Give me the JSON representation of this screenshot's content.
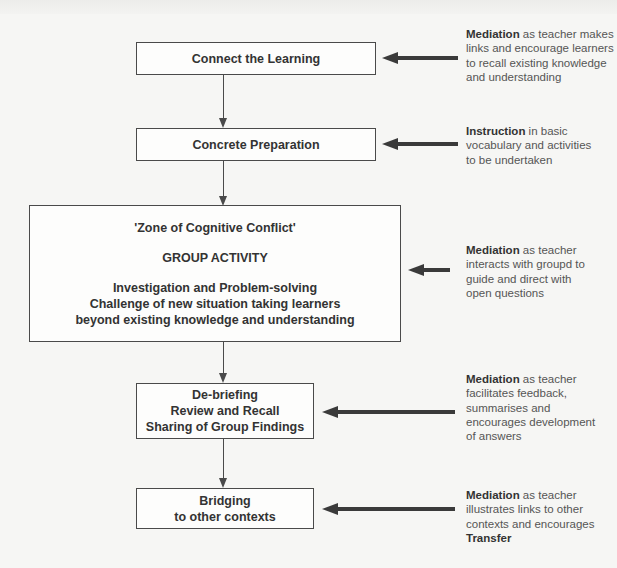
{
  "diagram": {
    "title": "",
    "steps": [
      {
        "id": "connect",
        "lines": [
          "Connect the Learning"
        ]
      },
      {
        "id": "concrete",
        "lines": [
          "Concrete Preparation"
        ]
      },
      {
        "id": "zone",
        "heading": "'Zone of Cognitive Conflict'",
        "subheading": "GROUP ACTIVITY",
        "lines": [
          "Investigation and Problem-solving",
          "Challenge of new situation taking learners",
          "beyond existing knowledge and understanding"
        ]
      },
      {
        "id": "debrief",
        "lines": [
          "De-briefing",
          "Review and Recall",
          "Sharing of Group Findings"
        ]
      },
      {
        "id": "bridging",
        "lines": [
          "Bridging",
          "to other contexts"
        ]
      }
    ],
    "annotations": [
      {
        "target": "connect",
        "keyword": "Mediation",
        "text": " as teacher makes links and encourage learners to recall existing knowledge and understanding",
        "suffix_bold": ""
      },
      {
        "target": "concrete",
        "keyword": "Instruction",
        "text": " in basic vocabulary and activities to be undertaken",
        "suffix_bold": ""
      },
      {
        "target": "zone",
        "keyword": "Mediation",
        "text": " as teacher interacts with groupd to guide and direct with open questions",
        "suffix_bold": ""
      },
      {
        "target": "debrief",
        "keyword": "Mediation",
        "text": " as teacher facilitates feedback, summarises and encourages development of answers",
        "suffix_bold": ""
      },
      {
        "target": "bridging",
        "keyword": "Mediation",
        "text": " as teacher illustrates links to other contexts and encourages ",
        "suffix_bold": "Transfer"
      }
    ],
    "colors": {
      "line": "#4a4a4a",
      "arrow": "#3a3a3a",
      "text": "#333333",
      "note_text": "#555555",
      "background": "#f6f6f4"
    }
  }
}
